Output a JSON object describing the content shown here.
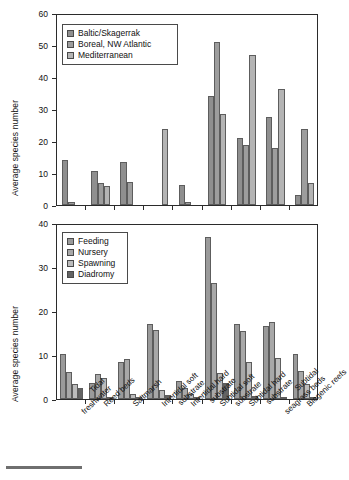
{
  "figure": {
    "width": 328,
    "height": 480,
    "background": "#ffffff",
    "axis_color": "#2b2b2b",
    "footer_rule": "horizontal-rule"
  },
  "categories": [
    "Tidal freshwater",
    "Reed beds",
    "Saltmarsh",
    "Intertidal soft substrate",
    "Intertidal hard substrate",
    "Subtidal soft substrate",
    "Subtidal hard substrate",
    "Subtidal seagrass beds",
    "Biogenic reefs"
  ],
  "category_lines": [
    [
      "Tidal",
      "freshwater"
    ],
    [
      "Reed beds"
    ],
    [
      "Saltmarsh"
    ],
    [
      "Intertidal soft",
      "substrate"
    ],
    [
      "Intertidal hard",
      "substrate"
    ],
    [
      "Subtidal soft",
      "substrate"
    ],
    [
      "Subtidal hard",
      "substrate"
    ],
    [
      "Subtidal",
      "seagrass beds"
    ],
    [
      "Biogenic reefs"
    ]
  ],
  "chart_data": [
    {
      "id": "top-chart",
      "type": "bar",
      "title": "",
      "xlabel": "",
      "ylabel": "Average species number",
      "ylim": [
        0,
        60
      ],
      "yticks": [
        0,
        10,
        20,
        30,
        40,
        50,
        60
      ],
      "grid": false,
      "legend_position": "top-left",
      "categories": [
        "Tidal freshwater",
        "Reed beds",
        "Saltmarsh",
        "Intertidal soft substrate",
        "Intertidal hard substrate",
        "Subtidal soft substrate",
        "Subtidal hard substrate",
        "Subtidal seagrass beds",
        "Biogenic reefs"
      ],
      "series": [
        {
          "name": "Baltic/Skagerrak",
          "color": "#8f8f8f",
          "values": [
            14.1,
            10.5,
            13.4,
            0,
            6.2,
            34.0,
            20.8,
            27.4,
            3.2
          ]
        },
        {
          "name": "Boreal, NW Atlantic",
          "color": "#9d9d9d",
          "values": [
            0.8,
            7.0,
            7.2,
            0,
            0.8,
            51.0,
            18.9,
            17.9,
            23.9
          ]
        },
        {
          "name": "Mediterranean",
          "color": "#b4b4b4",
          "values": [
            0,
            5.9,
            0,
            23.7,
            0,
            28.4,
            46.8,
            36.1,
            7.0
          ]
        }
      ]
    },
    {
      "id": "bottom-chart",
      "type": "bar",
      "title": "",
      "xlabel": "",
      "ylabel": "Average species number",
      "ylim": [
        0,
        40
      ],
      "yticks": [
        0,
        10,
        20,
        30,
        40
      ],
      "grid": false,
      "legend_position": "top-left",
      "categories": [
        "Tidal freshwater",
        "Reed beds",
        "Saltmarsh",
        "Intertidal soft substrate",
        "Intertidal hard substrate",
        "Subtidal soft substrate",
        "Subtidal hard substrate",
        "Subtidal seagrass beds",
        "Biogenic reefs"
      ],
      "series": [
        {
          "name": "Feeding",
          "color": "#9a9a9a",
          "values": [
            10.3,
            3.7,
            8.3,
            17.0,
            4.2,
            36.8,
            17.0,
            16.6,
            10.3
          ]
        },
        {
          "name": "Nursery",
          "color": "#a8a8a8",
          "values": [
            6.2,
            5.6,
            9.1,
            15.6,
            2.4,
            26.4,
            15.4,
            17.4,
            6.3
          ]
        },
        {
          "name": "Spawning",
          "color": "#bcbcbc",
          "values": [
            3.5,
            4.7,
            1.2,
            2.0,
            1.2,
            5.9,
            8.4,
            9.4,
            3.4
          ]
        },
        {
          "name": "Diadromy",
          "color": "#636363",
          "values": [
            2.5,
            0.4,
            0.3,
            0.9,
            0.4,
            3.6,
            0.7,
            0.4,
            0.3
          ]
        }
      ]
    }
  ]
}
